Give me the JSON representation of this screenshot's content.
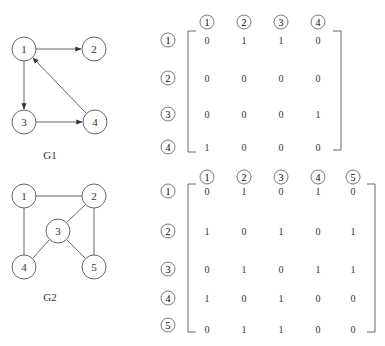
{
  "graphs": {
    "g1": {
      "label": "G1",
      "directed": true,
      "nodes": [
        {
          "id": "1",
          "x": 24,
          "y": 49
        },
        {
          "id": "2",
          "x": 94,
          "y": 49
        },
        {
          "id": "3",
          "x": 24,
          "y": 122
        },
        {
          "id": "4",
          "x": 95,
          "y": 122
        }
      ],
      "edges": [
        [
          "1",
          "2"
        ],
        [
          "1",
          "3"
        ],
        [
          "3",
          "4"
        ],
        [
          "4",
          "1"
        ]
      ]
    },
    "g2": {
      "label": "G2",
      "directed": false,
      "nodes": [
        {
          "id": "1",
          "x": 24,
          "y": 196
        },
        {
          "id": "2",
          "x": 94,
          "y": 196
        },
        {
          "id": "3",
          "x": 58,
          "y": 231
        },
        {
          "id": "4",
          "x": 24,
          "y": 267
        },
        {
          "id": "5",
          "x": 94,
          "y": 267
        }
      ],
      "edges": [
        [
          "1",
          "2"
        ],
        [
          "1",
          "4"
        ],
        [
          "2",
          "3"
        ],
        [
          "2",
          "5"
        ],
        [
          "3",
          "4"
        ],
        [
          "3",
          "5"
        ]
      ]
    }
  },
  "matrices": {
    "m1": {
      "col_labels": [
        "1",
        "2",
        "3",
        "4"
      ],
      "row_labels": [
        "1",
        "2",
        "3",
        "4"
      ],
      "rows": [
        [
          "0",
          "1",
          "1",
          "0"
        ],
        [
          "0",
          "0",
          "0",
          "0"
        ],
        [
          "0",
          "0",
          "0",
          "1"
        ],
        [
          "1",
          "0",
          "0",
          "0"
        ]
      ]
    },
    "m2": {
      "col_labels": [
        "1",
        "2",
        "3",
        "4",
        "5"
      ],
      "row_labels": [
        "1",
        "2",
        "3",
        "4",
        "5"
      ],
      "rows": [
        [
          "0",
          "1",
          "0",
          "1",
          "0"
        ],
        [
          "1",
          "0",
          "1",
          "0",
          "1"
        ],
        [
          "0",
          "1",
          "0",
          "1",
          "1"
        ],
        [
          "1",
          "0",
          "1",
          "0",
          "0"
        ],
        [
          "0",
          "1",
          "1",
          "0",
          "0"
        ]
      ]
    }
  }
}
